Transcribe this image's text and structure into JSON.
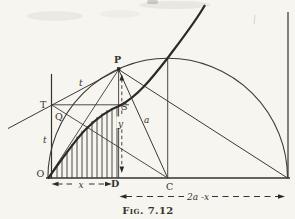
{
  "figure": {
    "caption": "Fig. 7.12",
    "paper_color": "#f6f5f0",
    "ink_color": "#35322e",
    "points": {
      "P": "P",
      "T": "T",
      "Q": "Q",
      "S": "S",
      "O": "O",
      "D": "D",
      "C": "C"
    },
    "measures": {
      "tangent_line": "t",
      "tangent_intercept": "t",
      "abscissa": "x",
      "ordinate": "y",
      "radius": "a",
      "remainder": "2a -x"
    }
  }
}
